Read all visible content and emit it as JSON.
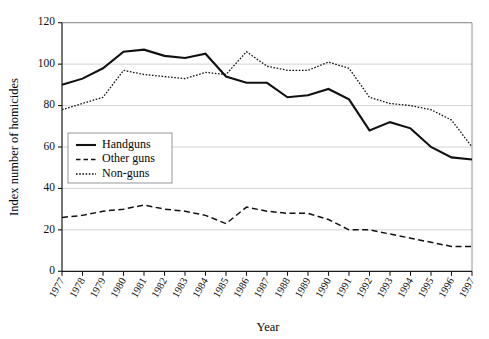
{
  "chart_data": {
    "type": "line",
    "title": "",
    "xlabel": "Year",
    "ylabel": "Index number of homicides",
    "xlim": [
      1977,
      1997
    ],
    "ylim": [
      0,
      120
    ],
    "ytick_step": 20,
    "grid": true,
    "legend_position": "center-left",
    "categories": [
      "1977",
      "1978",
      "1979",
      "1980",
      "1981",
      "1982",
      "1983",
      "1984",
      "1985",
      "1986",
      "1987",
      "1988",
      "1989",
      "1990",
      "1991",
      "1992",
      "1993",
      "1994",
      "1995",
      "1996",
      "1997"
    ],
    "yticks": [
      "0",
      "20",
      "40",
      "60",
      "80",
      "100",
      "120"
    ],
    "series": [
      {
        "name": "Handguns",
        "style": "solid",
        "color": "#111111",
        "values": [
          90,
          93,
          98,
          106,
          107,
          104,
          103,
          105,
          94,
          91,
          91,
          84,
          85,
          88,
          83,
          68,
          72,
          69,
          60,
          55,
          54
        ]
      },
      {
        "name": "Other guns",
        "style": "dashed",
        "color": "#111111",
        "values": [
          26,
          27,
          29,
          30,
          32,
          30,
          29,
          27,
          23,
          31,
          29,
          28,
          28,
          25,
          20,
          20,
          18,
          16,
          14,
          12,
          12
        ]
      },
      {
        "name": "Non-guns",
        "style": "dotted",
        "color": "#111111",
        "values": [
          78,
          81,
          84,
          97,
          95,
          94,
          93,
          96,
          95,
          106,
          99,
          97,
          97,
          101,
          98,
          84,
          81,
          80,
          78,
          73,
          60
        ]
      }
    ]
  },
  "legend": {
    "items": [
      {
        "label": "Handguns",
        "style": "solid"
      },
      {
        "label": "Other guns",
        "style": "dashed"
      },
      {
        "label": "Non-guns",
        "style": "dotted"
      }
    ]
  },
  "axes": {
    "x_title": "Year",
    "y_title": "Index number of homicides"
  }
}
